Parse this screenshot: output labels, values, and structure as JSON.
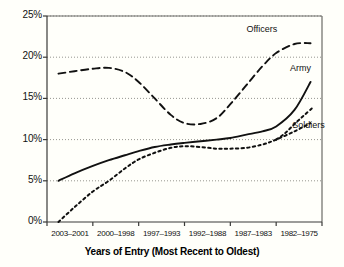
{
  "chart_data": {
    "type": "line",
    "title": "",
    "subtitle": "",
    "xlabel": "Years of Entry (Most Recent to Oldest)",
    "ylabel": "",
    "categories": [
      "2003–2001",
      "2000–1998",
      "1997–1993",
      "1992–1988",
      "1987–1983",
      "1982–1975"
    ],
    "ylim": [
      0,
      25
    ],
    "yticks": [
      0,
      5,
      10,
      15,
      20,
      25
    ],
    "ytick_labels": [
      "0%",
      "5%",
      "10%",
      "15%",
      "20%",
      "25%"
    ],
    "grid": "horizontal-dotted",
    "legend": "inline-annotations",
    "series": [
      {
        "name": "Officers",
        "style": "dashed",
        "color": "#111111",
        "x": [
          0.25,
          0.6,
          1.0,
          1.35,
          1.7,
          2.0,
          2.35,
          2.7,
          3.0,
          3.35,
          3.7,
          4.0,
          4.35,
          4.7,
          5.0,
          5.4,
          5.75
        ],
        "values": [
          18.0,
          18.3,
          18.6,
          18.7,
          18.2,
          17.0,
          15.0,
          13.0,
          12.0,
          11.9,
          12.6,
          14.3,
          16.6,
          18.9,
          20.5,
          21.6,
          21.7
        ]
      },
      {
        "name": "Army",
        "style": "solid",
        "color": "#111111",
        "x": [
          0.25,
          0.6,
          1.0,
          1.35,
          1.7,
          2.0,
          2.35,
          2.7,
          3.0,
          3.35,
          3.7,
          4.0,
          4.35,
          4.7,
          5.0,
          5.4,
          5.75
        ],
        "values": [
          5.0,
          5.9,
          6.8,
          7.5,
          8.1,
          8.6,
          9.1,
          9.4,
          9.6,
          9.8,
          10.0,
          10.2,
          10.6,
          11.0,
          11.6,
          13.6,
          17.0
        ]
      },
      {
        "name": "Soldiers",
        "style": "dotted",
        "color": "#111111",
        "x": [
          0.25,
          0.6,
          1.0,
          1.35,
          1.7,
          2.0,
          2.35,
          2.7,
          3.0,
          3.35,
          3.7,
          4.0,
          4.35,
          4.7,
          5.0,
          5.4,
          5.75
        ],
        "values": [
          0.0,
          1.8,
          3.7,
          5.0,
          6.5,
          7.6,
          8.4,
          9.0,
          9.2,
          9.1,
          8.9,
          8.9,
          9.0,
          9.4,
          10.0,
          11.0,
          12.0
        ]
      }
    ],
    "soldiers_tail": {
      "x": [
        5.0,
        5.2,
        5.4,
        5.6,
        5.78
      ],
      "values": [
        10.0,
        10.8,
        11.9,
        12.9,
        13.8
      ]
    },
    "annotations": [
      {
        "text": "Officers",
        "x": 4.35,
        "y": 23.3
      },
      {
        "text": "Army",
        "x": 5.3,
        "y": 18.6
      },
      {
        "text": "Soldiers",
        "x": 5.35,
        "y": 11.6
      }
    ]
  },
  "axis": {
    "x_title": "Years of Entry (Most Recent to Oldest)"
  }
}
